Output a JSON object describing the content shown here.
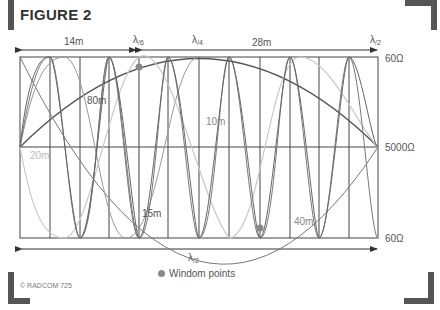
{
  "figure": {
    "title": "FIGURE 2",
    "copyright": "© RADCOM 725",
    "legend": "Windom points",
    "top_labels": {
      "span1": "14m",
      "span2": "28m",
      "lambda6": "λ",
      "lambda6_sub": "/6",
      "lambda4": "λ",
      "lambda4_sub": "/4",
      "lambda2": "λ",
      "lambda2_sub": "/2"
    },
    "bottom_label": {
      "text": "λ",
      "sub": "/2"
    },
    "right_labels": [
      "60Ω",
      "5000Ω",
      "60Ω"
    ],
    "curve_labels": {
      "80m": "80m",
      "20m": "20m",
      "10m": "10m",
      "15m": "15m",
      "40m": "40m"
    },
    "colors": {
      "dark": "#555555",
      "mid": "#777777",
      "light": "#c8c8c8",
      "grid": "#444444",
      "accent": "#888888"
    }
  }
}
